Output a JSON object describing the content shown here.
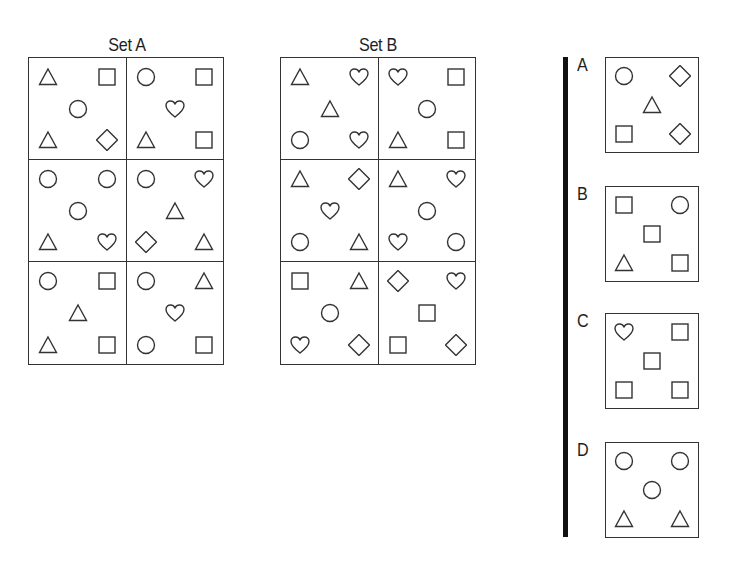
{
  "set_a": {
    "title": "Set A",
    "cells": [
      [
        "triangle",
        "square",
        "circle",
        "triangle",
        "diamond"
      ],
      [
        "circle",
        "square",
        "heart",
        "triangle",
        "square"
      ],
      [
        "circle",
        "circle",
        "circle",
        "triangle",
        "heart"
      ],
      [
        "circle",
        "heart",
        "triangle",
        "diamond",
        "triangle"
      ],
      [
        "circle",
        "square",
        "triangle",
        "triangle",
        "square"
      ],
      [
        "circle",
        "triangle",
        "heart",
        "circle",
        "square"
      ]
    ]
  },
  "set_b": {
    "title": "Set B",
    "cells": [
      [
        "triangle",
        "heart",
        "triangle",
        "circle",
        "heart"
      ],
      [
        "heart",
        "square",
        "circle",
        "triangle",
        "square"
      ],
      [
        "triangle",
        "diamond",
        "heart",
        "circle",
        "triangle"
      ],
      [
        "triangle",
        "heart",
        "circle",
        "heart",
        "circle"
      ],
      [
        "square",
        "triangle",
        "circle",
        "heart",
        "diamond"
      ],
      [
        "diamond",
        "heart",
        "square",
        "square",
        "diamond"
      ]
    ]
  },
  "slot_order": [
    "top-left",
    "top-right",
    "center",
    "bottom-left",
    "bottom-right"
  ],
  "options": [
    {
      "label": "A",
      "shapes": [
        "circle",
        "diamond",
        "triangle",
        "square",
        "diamond"
      ]
    },
    {
      "label": "B",
      "shapes": [
        "square",
        "circle",
        "square",
        "triangle",
        "square"
      ]
    },
    {
      "label": "C",
      "shapes": [
        "heart",
        "square",
        "square",
        "square",
        "square"
      ]
    },
    {
      "label": "D",
      "shapes": [
        "circle",
        "circle",
        "circle",
        "triangle",
        "triangle"
      ]
    }
  ],
  "colors": {
    "stroke": "#333333",
    "divider": "#111111",
    "background": "#ffffff"
  }
}
